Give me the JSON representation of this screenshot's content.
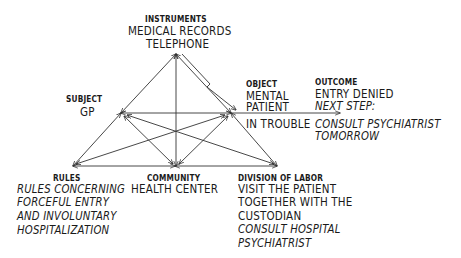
{
  "diagram": {
    "type": "activity-system-triangle",
    "instruments": {
      "header": "INSTRUMENTS",
      "lines": [
        "MEDICAL RECORDS",
        "TELEPHONE"
      ]
    },
    "subject": {
      "header": "SUBJECT",
      "lines": [
        "GP"
      ]
    },
    "object": {
      "header": "OBJECT",
      "lines": [
        "MENTAL",
        "PATIENT",
        "IN TROUBLE"
      ]
    },
    "outcome": {
      "header": "OUTCOME",
      "lines": [
        "ENTRY DENIED"
      ],
      "next_step_label": "NEXT STEP:",
      "next_step_lines": [
        "CONSULT PSYCHIATRIST",
        "TOMORROW"
      ]
    },
    "rules": {
      "header": "RULES",
      "italic_lines": [
        "RULES CONCERNING",
        "FORCEFUL ENTRY",
        "AND INVOLUNTARY",
        "HOSPITALIZATION"
      ]
    },
    "community": {
      "header": "COMMUNITY",
      "lines": [
        "HEALTH CENTER"
      ]
    },
    "division_of_labor": {
      "header": "DIVISION OF LABOR",
      "lines": [
        "VISIT THE PATIENT",
        "TOGETHER WITH THE",
        "CUSTODIAN"
      ],
      "italic_lines": [
        "CONSULT HOSPITAL",
        "PSYCHIATRIST"
      ]
    },
    "line_color": "#333333"
  }
}
